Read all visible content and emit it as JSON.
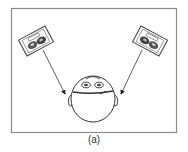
{
  "figure": {
    "caption": "(a)",
    "elements": {
      "left_speaker": "loudspeaker",
      "right_speaker": "loudspeaker",
      "listener": "head-top-view",
      "left_arrow": "sound path to left ear",
      "right_arrow": "sound path to right ear"
    },
    "colors": {
      "frame": "#8a8a8a",
      "line": "#333333",
      "background": "#ffffff"
    }
  }
}
